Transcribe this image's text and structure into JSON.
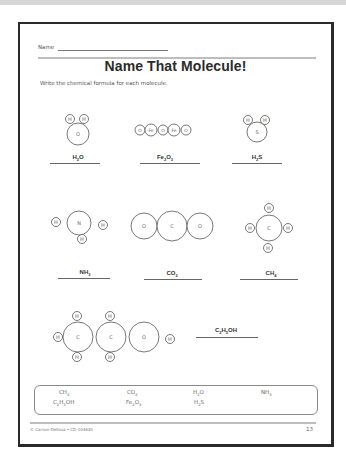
{
  "worksheet": {
    "name_label": "Name",
    "title": "Name That Molecule!",
    "instructions": "Write the chemical formula for each molecule."
  },
  "molecules": [
    {
      "id": "water",
      "atoms": [
        "H",
        "H",
        "O"
      ],
      "answer": {
        "main": "H",
        "sub": "2",
        "rest": "O"
      }
    },
    {
      "id": "iron-oxide",
      "atoms": [
        "O",
        "Fe",
        "O",
        "Fe",
        "O"
      ],
      "answer": {
        "main": "Fe",
        "sub": "2",
        "rest": "O",
        "sub2": "3"
      }
    },
    {
      "id": "hydrogen-sulfide",
      "atoms": [
        "H",
        "H",
        "S"
      ],
      "answer": {
        "main": "H",
        "sub": "2",
        "rest": "S"
      }
    },
    {
      "id": "ammonia",
      "atoms": [
        "H",
        "N",
        "H",
        "H"
      ],
      "answer": {
        "main": "NH",
        "sub": "3"
      }
    },
    {
      "id": "carbon-dioxide",
      "atoms": [
        "O",
        "C",
        "O"
      ],
      "answer": {
        "main": "CO",
        "sub": "2"
      }
    },
    {
      "id": "methane",
      "atoms": [
        "H",
        "H",
        "C",
        "H",
        "H"
      ],
      "answer": {
        "main": "CH",
        "sub": "4"
      }
    },
    {
      "id": "ethanol",
      "atoms": [
        "H",
        "H",
        "H",
        "C",
        "C",
        "H",
        "H",
        "O",
        "H"
      ],
      "answer": {
        "main": "C",
        "sub": "2",
        "rest": "H",
        "sub2": "5",
        "rest2": "OH"
      }
    }
  ],
  "word_bank": [
    {
      "main": "CH",
      "sub": "4"
    },
    {
      "main": "CO",
      "sub": "2"
    },
    {
      "main": "H",
      "sub": "2",
      "rest": "O"
    },
    {
      "main": "NH",
      "sub": "3"
    },
    {
      "main": "C",
      "sub": "2",
      "rest": "H",
      "sub2": "5",
      "rest2": "OH"
    },
    {
      "main": "Fe",
      "sub": "2",
      "rest": "O",
      "sub2": "3"
    },
    {
      "main": "H",
      "sub": "2",
      "rest": "S"
    }
  ],
  "footer": {
    "copyright": "© Carson-Dellosa • CD-104640",
    "page_number": "13"
  }
}
